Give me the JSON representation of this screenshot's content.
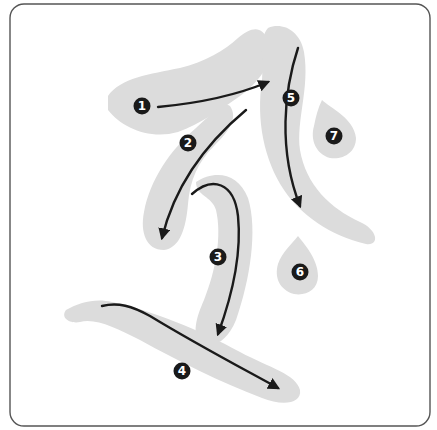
{
  "diagram": {
    "colors": {
      "background": "#ffffff",
      "frame": "#555555",
      "character_shape": "#dcdcdc",
      "arrow": "#1a1a1a",
      "badge_fill": "#1a1a1a",
      "badge_text": "#ffffff"
    },
    "strokes": [
      {
        "order": "1",
        "label_x": 142,
        "label_y": 106
      },
      {
        "order": "2",
        "label_x": 188,
        "label_y": 143
      },
      {
        "order": "3",
        "label_x": 218,
        "label_y": 257
      },
      {
        "order": "4",
        "label_x": 182,
        "label_y": 371
      },
      {
        "order": "5",
        "label_x": 291,
        "label_y": 98
      },
      {
        "order": "6",
        "label_x": 300,
        "label_y": 272
      },
      {
        "order": "7",
        "label_x": 334,
        "label_y": 136
      }
    ]
  }
}
